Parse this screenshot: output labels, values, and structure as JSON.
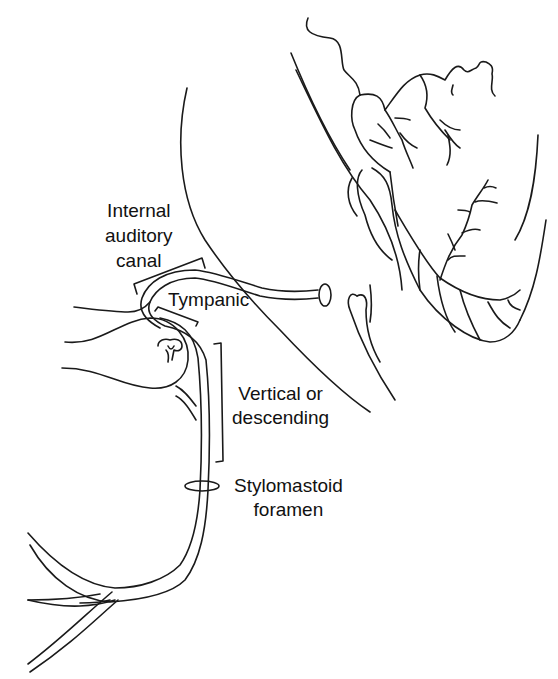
{
  "figure": {
    "stroke_color": "#1a1a1a",
    "background": "#ffffff"
  },
  "labels": {
    "internal_auditory_canal": "Internal\nauditory\ncanal",
    "tympanic": "Tympanic",
    "vertical_or_descending": "Vertical or\ndescending",
    "stylomastoid_foramen": "Stylomastoid\nforamen"
  }
}
